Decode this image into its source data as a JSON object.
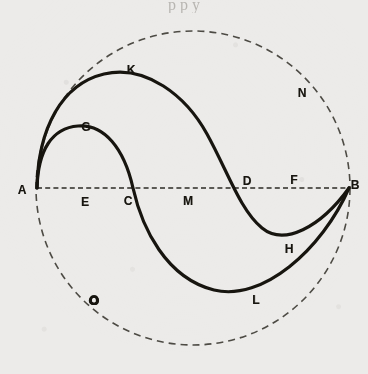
{
  "figure": {
    "kind": "geometric-diagram",
    "background_color": "#ecebe9",
    "ink_color": "#17150f",
    "width": 368,
    "height": 374,
    "caption_remnant": "p p y",
    "circle": {
      "name": "dashed-bounding-circle",
      "center_x": 193,
      "center_y": 188,
      "radius": 157,
      "style": "dashed",
      "stroke_width": 1.6
    },
    "axis": {
      "name": "diameter-A-B",
      "x1": 37,
      "y1": 188,
      "x2": 350,
      "y2": 188,
      "style": "dashed",
      "stroke_width": 1.4
    },
    "curves": [
      {
        "name": "outer-s-curve-A-K-D-H-B",
        "through": [
          "A",
          "K",
          "D",
          "H",
          "B"
        ],
        "style": "solid",
        "stroke_width": 3.2,
        "path": "M 37 188 C 38 128 62 84 104 74 C 146 64 186 96 207 134 C 228 172 240 210 262 228 C 284 246 320 228 349 188"
      },
      {
        "name": "inner-s-curve-A-G-C-L-B",
        "through": [
          "A",
          "G",
          "C",
          "L",
          "B"
        ],
        "style": "solid",
        "stroke_width": 3.2,
        "path": "M 37 188 C 38 150 52 128 78 126 C 104 124 124 148 133 188 C 142 228 166 278 214 290 C 262 302 322 250 349 188"
      }
    ],
    "labels": [
      {
        "id": "A",
        "text": "A",
        "x": 22,
        "y": 190,
        "note": "left end of diameter"
      },
      {
        "id": "B",
        "text": "B",
        "x": 355,
        "y": 185,
        "note": "right end of diameter"
      },
      {
        "id": "C",
        "text": "C",
        "x": 128,
        "y": 201,
        "note": "inner curve crosses axis"
      },
      {
        "id": "D",
        "text": "D",
        "x": 247,
        "y": 181,
        "note": "outer curve crosses axis"
      },
      {
        "id": "E",
        "text": "E",
        "x": 85,
        "y": 202,
        "note": "on axis between A and C"
      },
      {
        "id": "F",
        "text": "F",
        "x": 294,
        "y": 180,
        "note": "on axis between D and B"
      },
      {
        "id": "G",
        "text": "G",
        "x": 86,
        "y": 127,
        "note": "apex of inner curve"
      },
      {
        "id": "H",
        "text": "H",
        "x": 289,
        "y": 249,
        "note": "trough of outer curve"
      },
      {
        "id": "K",
        "text": "K",
        "x": 131,
        "y": 70,
        "note": "apex of outer curve"
      },
      {
        "id": "L",
        "text": "L",
        "x": 256,
        "y": 300,
        "note": "trough of inner curve"
      },
      {
        "id": "M",
        "text": "M",
        "x": 188,
        "y": 201,
        "note": "midpoint of axis"
      },
      {
        "id": "N",
        "text": "N",
        "x": 302,
        "y": 93,
        "note": "on dashed circle, upper right"
      },
      {
        "id": "O",
        "text": "O",
        "x": 94,
        "y": 300,
        "note": "on dashed circle, lower left; heavy inked glyph"
      }
    ]
  }
}
